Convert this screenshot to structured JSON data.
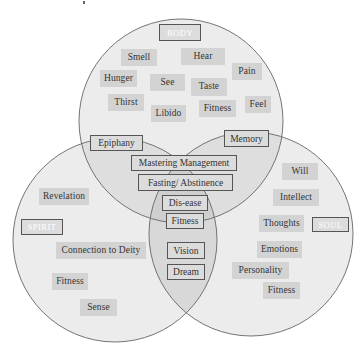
{
  "diagram": {
    "type": "venn",
    "colors": {
      "circle_fill": "#ececec",
      "overlap_fill": "#d9d9d9",
      "center_fill": "#cfcfcf",
      "circle_stroke": "#666666",
      "tag_fill": "#d3d3d3",
      "label_text": "#ffffff",
      "text": "#333333"
    },
    "circles": {
      "body": {
        "label": "BODY",
        "items": [
          "Smell",
          "Hear",
          "Hunger",
          "See",
          "Pain",
          "Taste",
          "Thirst",
          "Fitness",
          "Feel",
          "Libido"
        ]
      },
      "spirit": {
        "label": "SPIRIT",
        "items": [
          "Revelation",
          "Connection to Deity",
          "Fitness",
          "Sense"
        ]
      },
      "soul": {
        "label": "SOUL",
        "items": [
          "Will",
          "Intellect",
          "Thoughts",
          "Emotions",
          "Personality",
          "Fitness"
        ]
      }
    },
    "overlaps": {
      "body_spirit": [
        "Epiphany"
      ],
      "body_soul": [
        "Memory"
      ],
      "body_spirit_soul": [
        "Mastering Management",
        "Fasting/ Abstinence",
        "Dis-ease",
        "Fitness"
      ],
      "spirit_soul": [
        "Vision",
        "Dream"
      ]
    }
  }
}
